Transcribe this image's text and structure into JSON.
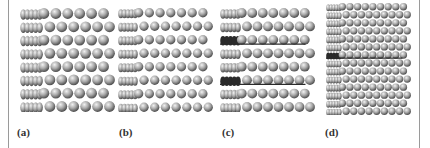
{
  "figure": {
    "panels": [
      {
        "id": "a",
        "label": "(a)",
        "layers": 8,
        "cols": 11,
        "sphere": 11,
        "left": 20,
        "width": 95,
        "height": 104,
        "stacking_faults": []
      },
      {
        "id": "b",
        "label": "(b)",
        "layers": 8,
        "cols": 12,
        "sphere": 9.5,
        "left": 118,
        "width": 95,
        "height": 104,
        "stacking_faults": []
      },
      {
        "id": "c",
        "label": "(c)",
        "layers": 8,
        "cols": 12,
        "sphere": 10,
        "left": 220,
        "width": 95,
        "height": 104,
        "stacking_faults": [
          2,
          5
        ]
      },
      {
        "id": "d",
        "label": "(d)",
        "layers": 14,
        "cols": 14,
        "sphere": 7.5,
        "left": 326,
        "width": 85,
        "height": 112,
        "stacking_faults": [
          6
        ]
      }
    ],
    "colors": {
      "sphere_light": "#f2f2f2",
      "sphere_mid": "#a8a8a8",
      "sphere_dark": "#555555",
      "fault": "#2a2a2a",
      "border": "#9a9a9a"
    }
  }
}
